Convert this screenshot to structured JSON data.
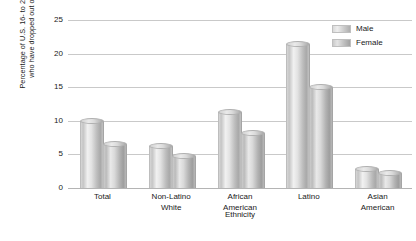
{
  "chart_data": {
    "type": "bar",
    "title": "",
    "xlabel": "Ethnicity",
    "ylabel": "Percentage of U.S. 16- to 24-year-olds\nwho have dropped out of school",
    "categories": [
      "Total",
      "Non-Latino\nWhite",
      "African\nAmerican",
      "Latino",
      "Asian\nAmerican"
    ],
    "series": [
      {
        "name": "Male",
        "values": [
          9.9,
          6.2,
          11.3,
          21.5,
          2.8
        ]
      },
      {
        "name": "Female",
        "values": [
          6.6,
          4.8,
          8.2,
          15.0,
          2.2
        ]
      }
    ],
    "ylim": [
      0,
      25
    ],
    "yticks": [
      0,
      5,
      10,
      15,
      20,
      25
    ],
    "ytick_labels": [
      "0",
      "5",
      "10",
      "15",
      "20",
      "25"
    ],
    "grid": true,
    "legend_position": "top-right",
    "legend": [
      "Male",
      "Female"
    ],
    "colors": {
      "male_fill": "#dcdcdc",
      "female_fill": "#c8c8c8",
      "gridline": "#c9c9c9",
      "text": "#1a1a1a",
      "background": "#ffffff"
    }
  }
}
